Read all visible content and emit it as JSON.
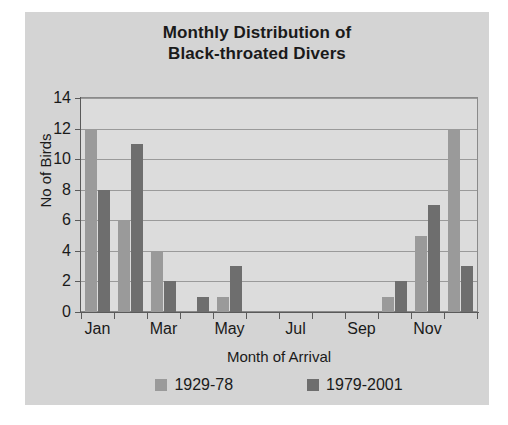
{
  "chart_data": {
    "type": "bar",
    "title": "Monthly Distribution of Black-throated Divers",
    "title_lines": [
      "Monthly Distribution of",
      "Black-throated Divers"
    ],
    "xlabel": "Month of Arrival",
    "ylabel": "No of Birds",
    "ylim": [
      0,
      14
    ],
    "ytick_step": 2,
    "yticks": [
      0,
      2,
      4,
      6,
      8,
      10,
      12,
      14
    ],
    "grid": true,
    "legend_position": "bottom",
    "categories": [
      "Jan",
      "Feb",
      "Mar",
      "Apr",
      "May",
      "Jun",
      "Jul",
      "Aug",
      "Sep",
      "Oct",
      "Nov",
      "Dec"
    ],
    "visible_tick_labels": [
      "Jan",
      "Mar",
      "May",
      "Jul",
      "Sep",
      "Nov"
    ],
    "series": [
      {
        "name": "1929-78",
        "color": "#9a9a9a",
        "values": [
          12,
          6,
          4,
          0,
          1,
          0,
          0,
          0,
          0,
          1,
          5,
          12
        ]
      },
      {
        "name": "1979-2001",
        "color": "#6e6e6e",
        "values": [
          8,
          11,
          2,
          1,
          3,
          0,
          0,
          0,
          0,
          2,
          7,
          3
        ]
      }
    ]
  },
  "colors": {
    "card_background": "#d4d4d4",
    "plot_background": "#dcdcdc",
    "gridline": "#9a9a9a",
    "axis": "#5a5a5a",
    "text": "#1a1a1a",
    "series_1929_78": "#9a9a9a",
    "series_1979_2001": "#6e6e6e"
  }
}
